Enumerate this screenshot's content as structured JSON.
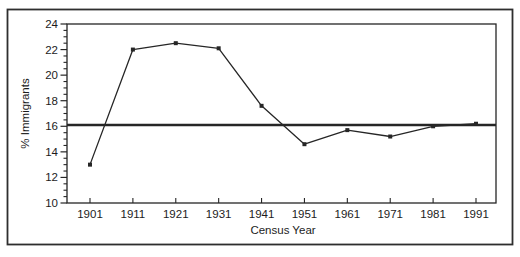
{
  "figure": {
    "background": "#ffffff",
    "ink_color": "#262626",
    "frame_color": "#2e2e2e"
  },
  "chart_data": {
    "type": "line",
    "title": "",
    "xlabel": "Census Year",
    "ylabel": "% Immigrants",
    "categories": [
      "1901",
      "1911",
      "1921",
      "1931",
      "1941",
      "1951",
      "1961",
      "1971",
      "1981",
      "1991"
    ],
    "series": [
      {
        "name": "% Immigrants",
        "values": [
          13.0,
          22.0,
          22.5,
          22.1,
          17.6,
          14.6,
          15.7,
          15.2,
          16.0,
          16.2
        ]
      }
    ],
    "reference_line": {
      "orientation": "horizontal",
      "value": 16.1
    },
    "ylim": [
      10,
      24
    ],
    "y_major_ticks": [
      10,
      12,
      14,
      16,
      18,
      20,
      22,
      24
    ],
    "y_minor_tick_step": 0.5,
    "x_tick_labels": [
      "1901",
      "1911",
      "1921",
      "1931",
      "1941",
      "1951",
      "1961",
      "1971",
      "1981",
      "1991"
    ],
    "grid": "off",
    "legend": "none",
    "marker": "square",
    "plot_box": "closed"
  }
}
